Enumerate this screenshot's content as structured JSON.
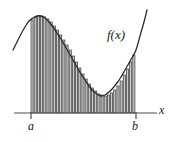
{
  "figure": {
    "kind": "riemann-sum-diagram",
    "background_color": "#ffffff"
  },
  "labels": {
    "function_label": "f(x)",
    "lower_limit": "a",
    "upper_limit": "b",
    "axis_label": "x"
  },
  "colors": {
    "curve": "#2b2b2b",
    "axis": "#4d4d4d",
    "bar_fill": "#cccccc",
    "bar_stroke": "#333333",
    "text": "#1a1a1a"
  },
  "chart_data": {
    "type": "area",
    "title": "",
    "xlabel": "x",
    "ylabel": "",
    "grid": false,
    "legend": null,
    "annotations": [
      {
        "text": "f(x)",
        "x": 107,
        "y": 28
      },
      {
        "text": "a",
        "x": 28,
        "y": 120
      },
      {
        "text": "b",
        "x": 132,
        "y": 120
      },
      {
        "text": "x",
        "x": 159,
        "y": 104
      }
    ],
    "axis": {
      "baseline_y": 113,
      "x_start": 14,
      "x_end": 157,
      "tick_a_x": 31,
      "tick_b_x": 136,
      "tick_height": 6
    },
    "curve": {
      "description": "smooth curve rising from lower-left to a peak, falling to a minimum, then rising steeply past b",
      "x_start": 13,
      "x_end": 147,
      "points": [
        [
          13,
          50
        ],
        [
          17,
          42
        ],
        [
          21,
          34
        ],
        [
          25,
          27
        ],
        [
          29,
          21
        ],
        [
          33,
          18
        ],
        [
          37,
          16
        ],
        [
          41,
          16
        ],
        [
          45,
          18
        ],
        [
          49,
          22
        ],
        [
          53,
          27
        ],
        [
          57,
          33
        ],
        [
          61,
          39
        ],
        [
          65,
          46
        ],
        [
          69,
          53
        ],
        [
          73,
          60
        ],
        [
          77,
          67
        ],
        [
          81,
          74
        ],
        [
          85,
          80
        ],
        [
          89,
          86
        ],
        [
          93,
          91
        ],
        [
          97,
          94
        ],
        [
          101,
          96
        ],
        [
          105,
          95
        ],
        [
          109,
          92
        ],
        [
          113,
          88
        ],
        [
          117,
          83
        ],
        [
          121,
          77
        ],
        [
          125,
          70
        ],
        [
          129,
          63
        ],
        [
          133,
          56
        ],
        [
          136,
          50
        ],
        [
          140,
          36
        ],
        [
          144,
          22
        ],
        [
          147,
          10
        ]
      ]
    },
    "bars": {
      "count": 33,
      "x_left": 31,
      "x_right": 136,
      "bar_width": 2.1,
      "gap": 1.08,
      "baseline_y": 113,
      "tops": [
        20,
        17,
        16,
        16,
        17,
        19,
        22,
        26,
        30,
        35,
        40,
        45,
        50,
        56,
        62,
        68,
        74,
        79,
        84,
        88,
        91,
        94,
        95,
        96,
        95,
        93,
        90,
        86,
        81,
        75,
        69,
        62,
        55
      ],
      "heights": [
        93,
        96,
        97,
        97,
        96,
        94,
        91,
        87,
        83,
        78,
        73,
        68,
        63,
        57,
        51,
        45,
        39,
        34,
        29,
        25,
        22,
        19,
        18,
        17,
        18,
        20,
        23,
        27,
        32,
        38,
        44,
        51,
        58
      ]
    }
  }
}
